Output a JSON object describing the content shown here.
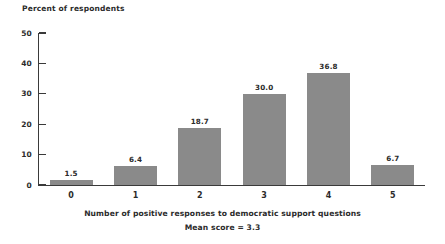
{
  "chart_data": {
    "type": "bar",
    "title": "",
    "ylabel": "Percent of respondents",
    "xlabel": "Number of positive responses to democratic support questions",
    "annotation": "Mean score = 3.3",
    "categories": [
      "0",
      "1",
      "2",
      "3",
      "4",
      "5"
    ],
    "values": [
      1.5,
      6.4,
      18.7,
      30.0,
      36.8,
      6.7
    ],
    "value_labels": [
      "1.5",
      "6.4",
      "18.7",
      "30.0",
      "36.8",
      "6.7"
    ],
    "ylim": [
      0,
      50
    ],
    "yticks": [
      0,
      10,
      20,
      30,
      40,
      50
    ],
    "ytick_labels": [
      "0",
      "10",
      "20",
      "30",
      "40",
      "50"
    ],
    "grid": false,
    "legend": false,
    "bar_color": "#8a8a8a",
    "axis_color": "#3a3a3a",
    "background_color": "#ffffff",
    "text_color": "#2b2b2b"
  }
}
